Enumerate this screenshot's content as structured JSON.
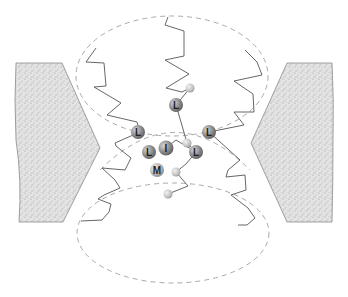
{
  "figure": {
    "type": "protein-channel-schematic",
    "colors": {
      "membrane_fill": "#d8d8d8",
      "membrane_stroke": "#8a8a8a",
      "helix_stroke": "#555555",
      "dashed_outline": "#aaaaaa",
      "residue_large": "#8c8c8c",
      "residue_small": "#c4c4c4"
    },
    "membrane_blocks": [
      {
        "side": "left"
      },
      {
        "side": "right"
      }
    ],
    "regions": [
      {
        "name": "upper-vestibule"
      },
      {
        "name": "central-gate"
      },
      {
        "name": "lower-vestibule"
      }
    ],
    "residues": [
      {
        "label": "L",
        "x": 176,
        "y": 105
      },
      {
        "label": "L",
        "x": 138,
        "y": 132
      },
      {
        "label": "L",
        "x": 209,
        "y": 132
      },
      {
        "label": "L",
        "x": 149,
        "y": 152
      },
      {
        "label": "I",
        "x": 166,
        "y": 148
      },
      {
        "label": "L",
        "x": 196,
        "y": 152
      },
      {
        "label": "M",
        "x": 157,
        "y": 170
      }
    ],
    "small_atoms": [
      {
        "x": 190,
        "y": 88
      },
      {
        "x": 187,
        "y": 143
      },
      {
        "x": 176,
        "y": 172
      },
      {
        "x": 168,
        "y": 194
      }
    ]
  }
}
